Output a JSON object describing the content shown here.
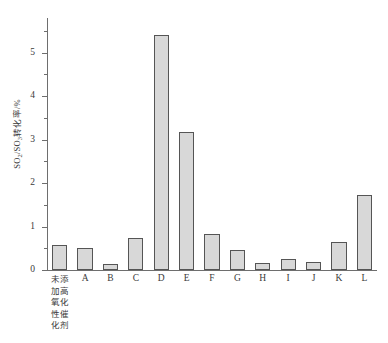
{
  "chart_data": {
    "type": "bar",
    "title": "",
    "xlabel": "",
    "ylabel": "SO2/SO3转化率/%",
    "ylabel_parts": {
      "pre": "SO",
      "sub1": "2",
      "mid": "/SO",
      "sub2": "3",
      "post": "转化率/%"
    },
    "categories": [
      "未添加高氧化性催化剂",
      "A",
      "B",
      "C",
      "D",
      "E",
      "F",
      "G",
      "H",
      "I",
      "J",
      "K",
      "L"
    ],
    "category_display": [
      "未添\n加高\n氧化\n性催\n化剂",
      "A",
      "B",
      "C",
      "D",
      "E",
      "F",
      "G",
      "H",
      "I",
      "J",
      "K",
      "L"
    ],
    "values": [
      0.58,
      0.5,
      0.13,
      0.73,
      5.42,
      3.17,
      0.84,
      0.47,
      0.16,
      0.26,
      0.18,
      0.65,
      1.72
    ],
    "ylim": [
      0,
      5.8
    ],
    "y_major_ticks": [
      0,
      1,
      2,
      3,
      4,
      5
    ],
    "y_major_tick_labels": [
      "0",
      "1",
      "2",
      "3",
      "4",
      "5"
    ],
    "y_minor_ticks": [
      0.5,
      1.5,
      2.5,
      3.5,
      4.5,
      5.5
    ],
    "grid": false,
    "legend": "none",
    "bar_fill_color": "#d8d8d8",
    "bar_border_color": "#555555",
    "axis_color": "#6e6e6e",
    "text_color": "#3a3a3a",
    "background_color": "#ffffff"
  }
}
